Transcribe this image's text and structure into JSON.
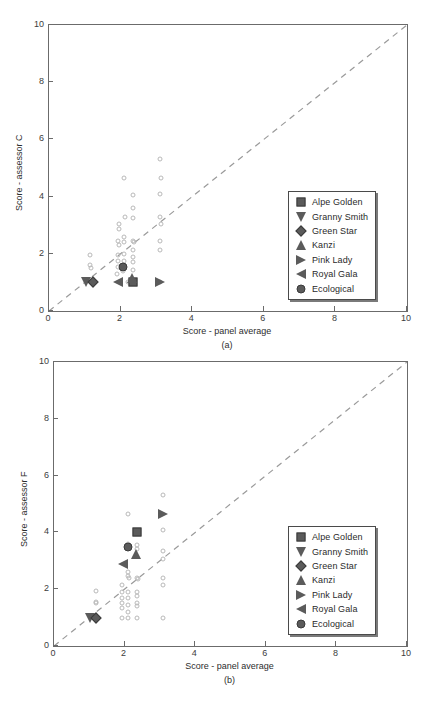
{
  "figure": {
    "panels": [
      {
        "caption": "(a)",
        "xlabel": "Score - panel average",
        "ylabel": "Score - assessor C"
      },
      {
        "caption": "(b)",
        "xlabel": "Score - panel average",
        "ylabel": "Score - assessor F"
      }
    ],
    "legend": {
      "items": [
        {
          "label": "Alpe Golden",
          "marker": "square",
          "icon": "square-marker-icon"
        },
        {
          "label": "Granny Smith",
          "marker": "tri-down",
          "icon": "triangle-down-marker-icon"
        },
        {
          "label": "Green Star",
          "marker": "diamond",
          "icon": "diamond-marker-icon"
        },
        {
          "label": "Kanzi",
          "marker": "tri-up",
          "icon": "triangle-up-marker-icon"
        },
        {
          "label": "Pink Lady",
          "marker": "tri-right",
          "icon": "triangle-right-marker-icon"
        },
        {
          "label": "Royal Gala",
          "marker": "tri-left",
          "icon": "triangle-left-marker-icon"
        },
        {
          "label": "Ecological",
          "marker": "circle",
          "icon": "circle-marker-icon"
        }
      ]
    },
    "colors": {
      "marker_fill": "#5b5b5b",
      "marker_edge": "#3a3a3a",
      "open_marker_edge": "#b9b9b9",
      "axis": "#6b6b6b",
      "identity_line": "#9a9a9a",
      "text": "#2d2d2d"
    }
  },
  "chart_data": [
    {
      "type": "scatter",
      "title": "",
      "panel": "(a)",
      "xlabel": "Score - panel average",
      "ylabel": "Score - assessor C",
      "xlim": [
        0,
        10
      ],
      "ylim": [
        0,
        10
      ],
      "xticks": [
        0,
        2,
        4,
        6,
        8,
        10
      ],
      "yticks": [
        0,
        2,
        4,
        6,
        8,
        10
      ],
      "grid": false,
      "legend_position": "lower-right",
      "reference_line": {
        "type": "identity",
        "style": "dashed",
        "from": [
          0,
          0
        ],
        "to": [
          10,
          10
        ]
      },
      "series": [
        {
          "name": "individual observations",
          "marker": "open-circle",
          "points": [
            [
              1.15,
              1.95
            ],
            [
              1.15,
              1.6
            ],
            [
              1.18,
              1.5
            ],
            [
              1.95,
              3.05
            ],
            [
              1.95,
              2.85
            ],
            [
              1.92,
              2.45
            ],
            [
              1.95,
              2.3
            ],
            [
              1.92,
              1.95
            ],
            [
              1.92,
              1.75
            ],
            [
              1.92,
              1.55
            ],
            [
              1.9,
              1.3
            ],
            [
              2.1,
              4.65
            ],
            [
              2.12,
              3.3
            ],
            [
              2.1,
              2.6
            ],
            [
              2.1,
              2.4
            ],
            [
              2.1,
              2.0
            ],
            [
              2.1,
              1.75
            ],
            [
              2.08,
              1.55
            ],
            [
              2.08,
              1.4
            ],
            [
              2.35,
              4.05
            ],
            [
              2.35,
              3.6
            ],
            [
              2.35,
              3.25
            ],
            [
              2.35,
              2.45
            ],
            [
              2.38,
              2.4
            ],
            [
              2.35,
              2.15
            ],
            [
              2.35,
              1.9
            ],
            [
              2.35,
              1.7
            ],
            [
              2.35,
              1.45
            ],
            [
              2.35,
              1.0
            ],
            [
              3.1,
              5.3
            ],
            [
              3.12,
              4.65
            ],
            [
              3.1,
              4.1
            ],
            [
              3.1,
              3.3
            ],
            [
              3.12,
              3.05
            ],
            [
              3.1,
              2.45
            ],
            [
              3.1,
              2.15
            ],
            [
              3.1,
              1.0
            ],
            [
              2.22,
              1.0
            ]
          ]
        },
        {
          "name": "Alpe Golden",
          "marker": "square",
          "points": [
            [
              2.35,
              1.0
            ]
          ]
        },
        {
          "name": "Granny Smith",
          "marker": "tri-down",
          "points": [
            [
              1.02,
              1.0
            ]
          ]
        },
        {
          "name": "Green Star",
          "marker": "diamond",
          "points": [
            [
              1.22,
              1.0
            ]
          ]
        },
        {
          "name": "Kanzi",
          "marker": "tri-up",
          "points": [
            [
              2.33,
              1.15
            ]
          ]
        },
        {
          "name": "Pink Lady",
          "marker": "tri-right",
          "points": [
            [
              3.1,
              1.0
            ]
          ]
        },
        {
          "name": "Royal Gala",
          "marker": "tri-left",
          "points": [
            [
              1.92,
              1.0
            ]
          ]
        },
        {
          "name": "Ecological",
          "marker": "circle",
          "points": [
            [
              2.08,
              1.55
            ]
          ]
        }
      ]
    },
    {
      "type": "scatter",
      "title": "",
      "panel": "(b)",
      "xlabel": "Score - panel average",
      "ylabel": "Score - assessor F",
      "xlim": [
        0,
        10
      ],
      "ylim": [
        0,
        10
      ],
      "xticks": [
        0,
        2,
        4,
        6,
        8,
        10
      ],
      "yticks": [
        0,
        2,
        4,
        6,
        8,
        10
      ],
      "grid": false,
      "legend_position": "lower-right",
      "reference_line": {
        "type": "identity",
        "style": "dashed",
        "from": [
          0,
          0
        ],
        "to": [
          10,
          10
        ]
      },
      "series": [
        {
          "name": "individual observations",
          "marker": "open-circle",
          "points": [
            [
              1.18,
              1.95
            ],
            [
              1.18,
              1.55
            ],
            [
              1.2,
              1.5
            ],
            [
              1.92,
              2.15
            ],
            [
              1.92,
              1.9
            ],
            [
              1.92,
              1.7
            ],
            [
              1.92,
              1.5
            ],
            [
              1.92,
              1.35
            ],
            [
              1.92,
              1.0
            ],
            [
              2.1,
              4.65
            ],
            [
              2.1,
              3.6
            ],
            [
              2.1,
              2.6
            ],
            [
              2.1,
              2.45
            ],
            [
              2.12,
              2.4
            ],
            [
              2.1,
              1.9
            ],
            [
              2.1,
              1.7
            ],
            [
              2.1,
              1.45
            ],
            [
              2.1,
              1.2
            ],
            [
              2.1,
              1.0
            ],
            [
              2.35,
              3.55
            ],
            [
              2.35,
              3.4
            ],
            [
              2.35,
              2.4
            ],
            [
              2.38,
              2.35
            ],
            [
              2.35,
              1.9
            ],
            [
              2.35,
              1.75
            ],
            [
              2.35,
              1.5
            ],
            [
              2.35,
              1.4
            ],
            [
              2.35,
              1.0
            ],
            [
              3.1,
              5.3
            ],
            [
              3.1,
              4.1
            ],
            [
              3.1,
              3.35
            ],
            [
              3.1,
              3.05
            ],
            [
              3.1,
              2.4
            ],
            [
              3.1,
              2.15
            ],
            [
              3.1,
              1.0
            ]
          ]
        },
        {
          "name": "Alpe Golden",
          "marker": "square",
          "points": [
            [
              2.35,
              4.02
            ]
          ]
        },
        {
          "name": "Granny Smith",
          "marker": "tri-down",
          "points": [
            [
              1.02,
              1.0
            ]
          ]
        },
        {
          "name": "Green Star",
          "marker": "diamond",
          "points": [
            [
              1.2,
              1.0
            ]
          ]
        },
        {
          "name": "Kanzi",
          "marker": "tri-up",
          "points": [
            [
              2.33,
              3.25
            ]
          ]
        },
        {
          "name": "Pink Lady",
          "marker": "tri-right",
          "points": [
            [
              3.08,
              4.65
            ]
          ]
        },
        {
          "name": "Royal Gala",
          "marker": "tri-left",
          "points": [
            [
              1.95,
              2.9
            ]
          ]
        },
        {
          "name": "Ecological",
          "marker": "circle",
          "points": [
            [
              2.1,
              3.48
            ]
          ]
        }
      ]
    }
  ]
}
